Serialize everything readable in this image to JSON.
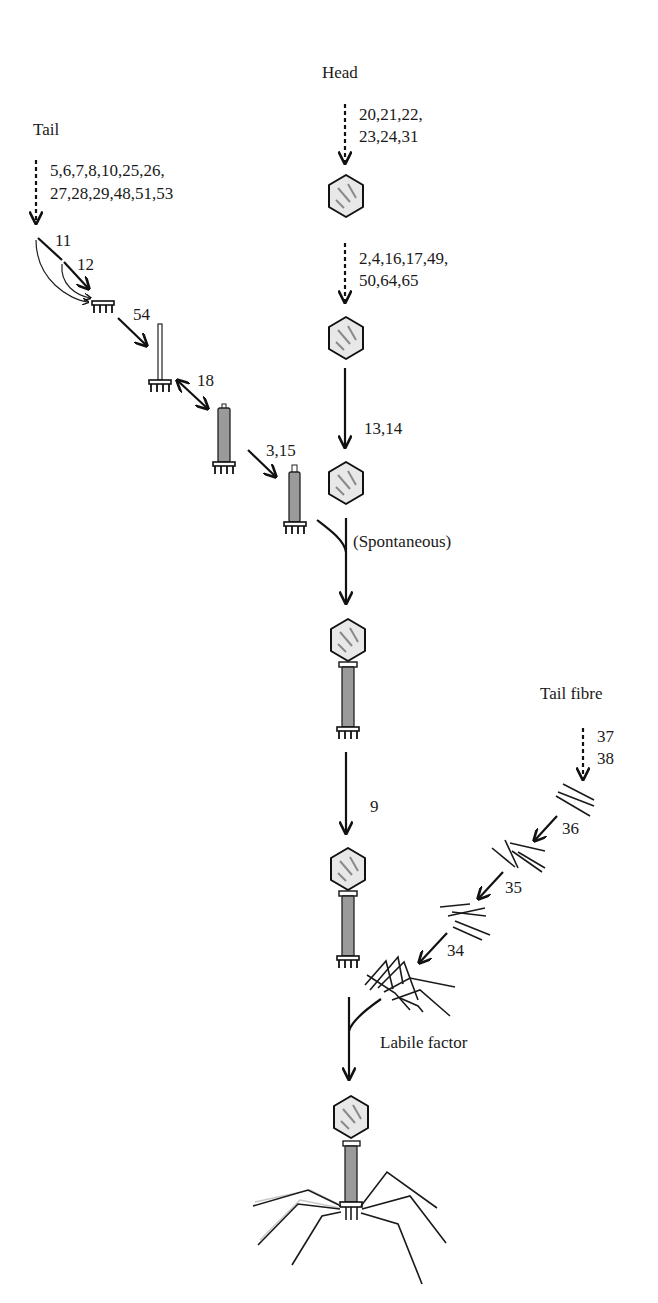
{
  "diagram": {
    "branches": {
      "head": {
        "label": "Head",
        "steps": [
          {
            "genes_line1": "20,21,22,",
            "genes_line2": "23,24,31",
            "arrow": "dashed"
          },
          {
            "genes_line1": "2,4,16,17,49,",
            "genes_line2": "50,64,65",
            "arrow": "dashed"
          },
          {
            "genes": "13,14",
            "arrow": "solid"
          }
        ]
      },
      "tail": {
        "label": "Tail",
        "steps": [
          {
            "genes_line1": "5,6,7,8,10,25,26,",
            "genes_line2": "27,28,29,48,51,53",
            "arrow": "dashed"
          },
          {
            "genes": "11",
            "arrow": "solid"
          },
          {
            "genes": "12",
            "arrow": "solid"
          },
          {
            "genes": "54",
            "arrow": "solid"
          },
          {
            "genes": "18",
            "arrow": "double"
          },
          {
            "genes": "3,15",
            "arrow": "solid"
          }
        ]
      },
      "tail_fibre": {
        "label": "Tail fibre",
        "steps": [
          {
            "genes_line1": "37",
            "genes_line2": "38",
            "arrow": "dashed"
          },
          {
            "genes": "36",
            "arrow": "solid"
          },
          {
            "genes": "35",
            "arrow": "solid"
          },
          {
            "genes": "34",
            "arrow": "solid"
          }
        ]
      }
    },
    "joins": {
      "head_tail": "(Spontaneous)",
      "neck": "9",
      "fibre_attach": "Labile factor"
    },
    "colors": {
      "ink": "#111111",
      "background": "#ffffff",
      "head_fill": "#e8e8e8",
      "sheath_fill": "#9a9a9a"
    }
  }
}
